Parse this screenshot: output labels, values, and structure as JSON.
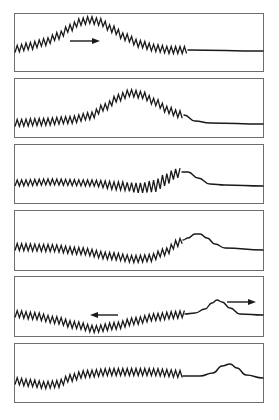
{
  "figure": {
    "colors": {
      "ink": "#1a1a1a",
      "frame": "#6e6e6e",
      "background": "#ffffff"
    },
    "junction_x": 188,
    "panels": [
      {
        "id": "panel-1",
        "frame": {
          "x": 14.5,
          "y": 13.5,
          "w": 249,
          "h": 58
        },
        "spring_center": [
          [
            15,
            49
          ],
          [
            30,
            46
          ],
          [
            45,
            42
          ],
          [
            58,
            36
          ],
          [
            70,
            28
          ],
          [
            80,
            22
          ],
          [
            90,
            20
          ],
          [
            100,
            22
          ],
          [
            112,
            29
          ],
          [
            125,
            37
          ],
          [
            140,
            44
          ],
          [
            155,
            48
          ],
          [
            170,
            50
          ],
          [
            188,
            50
          ]
        ],
        "spring_amplitude": 3.5,
        "rope": [
          [
            188,
            50
          ],
          [
            263,
            51
          ]
        ],
        "arrows": [
          {
            "x1": 70,
            "x2": 100,
            "y": 41,
            "direction": "right"
          }
        ]
      },
      {
        "id": "panel-2",
        "frame": {
          "x": 14.5,
          "y": 78.5,
          "w": 249,
          "h": 59
        },
        "spring_center": [
          [
            15,
            123
          ],
          [
            40,
            122
          ],
          [
            70,
            120
          ],
          [
            90,
            116
          ],
          [
            105,
            107
          ],
          [
            118,
            98
          ],
          [
            130,
            93
          ],
          [
            142,
            95
          ],
          [
            155,
            102
          ],
          [
            168,
            110
          ],
          [
            178,
            114
          ],
          [
            184,
            115
          ]
        ],
        "spring_amplitude": 3.5,
        "rope": [
          [
            184,
            115
          ],
          [
            195,
            121
          ],
          [
            210,
            123
          ],
          [
            263,
            124
          ]
        ],
        "arrows": []
      },
      {
        "id": "panel-3",
        "frame": {
          "x": 14.5,
          "y": 144.5,
          "w": 249,
          "h": 59
        },
        "spring_center": [
          [
            15,
            183
          ],
          [
            50,
            182
          ],
          [
            90,
            183
          ],
          [
            120,
            186
          ],
          [
            140,
            188
          ],
          [
            155,
            186
          ],
          [
            165,
            180
          ],
          [
            175,
            174
          ],
          [
            182,
            172
          ]
        ],
        "spring_amplitude": [
          3,
          3,
          3,
          4,
          5,
          6,
          6,
          5,
          4
        ],
        "rope": [
          [
            182,
            172
          ],
          [
            188,
            172
          ],
          [
            198,
            178
          ],
          [
            210,
            184
          ],
          [
            225,
            185
          ],
          [
            263,
            186
          ]
        ],
        "arrows": []
      },
      {
        "id": "panel-4",
        "frame": {
          "x": 14.5,
          "y": 210.5,
          "w": 249,
          "h": 60
        },
        "spring_center": [
          [
            15,
            247
          ],
          [
            50,
            248
          ],
          [
            80,
            251
          ],
          [
            110,
            256
          ],
          [
            135,
            259
          ],
          [
            150,
            258
          ],
          [
            165,
            252
          ],
          [
            178,
            243
          ],
          [
            183,
            240
          ]
        ],
        "spring_amplitude": 3.5,
        "rope": [
          [
            183,
            240
          ],
          [
            188,
            238
          ],
          [
            195,
            234
          ],
          [
            200,
            234
          ],
          [
            207,
            238
          ],
          [
            215,
            244
          ],
          [
            225,
            248
          ],
          [
            263,
            250
          ]
        ],
        "arrows": []
      },
      {
        "id": "panel-5",
        "frame": {
          "x": 14.5,
          "y": 276.5,
          "w": 249,
          "h": 60
        },
        "spring_center": [
          [
            15,
            314
          ],
          [
            35,
            316
          ],
          [
            55,
            320
          ],
          [
            75,
            325
          ],
          [
            95,
            329
          ],
          [
            115,
            326
          ],
          [
            135,
            321
          ],
          [
            155,
            317
          ],
          [
            175,
            315
          ],
          [
            185,
            314
          ]
        ],
        "spring_amplitude": 3.5,
        "rope": [
          [
            185,
            314
          ],
          [
            195,
            313
          ],
          [
            205,
            309
          ],
          [
            212,
            303
          ],
          [
            217,
            300
          ],
          [
            222,
            302
          ],
          [
            230,
            308
          ],
          [
            240,
            314
          ],
          [
            263,
            315
          ]
        ],
        "arrows": [
          {
            "x1": 118,
            "x2": 90,
            "y": 315,
            "direction": "left"
          },
          {
            "x1": 227,
            "x2": 256,
            "y": 302,
            "direction": "right"
          }
        ]
      },
      {
        "id": "panel-6",
        "frame": {
          "x": 14.5,
          "y": 343.5,
          "w": 249,
          "h": 59
        },
        "spring_center": [
          [
            15,
            381
          ],
          [
            30,
            383
          ],
          [
            45,
            385
          ],
          [
            58,
            384
          ],
          [
            70,
            378
          ],
          [
            85,
            374
          ],
          [
            110,
            372
          ],
          [
            150,
            372
          ],
          [
            183,
            374
          ]
        ],
        "spring_amplitude": 3.5,
        "rope": [
          [
            183,
            376
          ],
          [
            200,
            376
          ],
          [
            213,
            373
          ],
          [
            222,
            366
          ],
          [
            230,
            364
          ],
          [
            237,
            368
          ],
          [
            246,
            375
          ],
          [
            263,
            378
          ]
        ],
        "arrows": []
      }
    ]
  }
}
